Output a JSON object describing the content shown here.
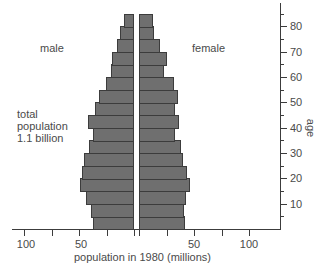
{
  "chart_data": {
    "type": "bar",
    "orientation": "horizontal",
    "subtype": "population-pyramid",
    "title": "",
    "xlabel": "population in 1980 (millions)",
    "ylabel": "age",
    "annotations": {
      "male_label": "male",
      "female_label": "female",
      "total_line1": "total",
      "total_line2": "population",
      "total_line3": "1.1 billion"
    },
    "categories": [
      "0-4",
      "5-9",
      "10-14",
      "15-19",
      "20-24",
      "25-29",
      "30-34",
      "35-39",
      "40-44",
      "45-49",
      "50-54",
      "55-59",
      "60-64",
      "65-69",
      "70-74",
      "75-79",
      "80-84"
    ],
    "series": [
      {
        "name": "male",
        "values": [
          37,
          39,
          44,
          49,
          47,
          45,
          41,
          37,
          42,
          35,
          32,
          25,
          21,
          20,
          15,
          12.5,
          9
        ]
      },
      {
        "name": "female",
        "values": [
          42,
          41,
          42.5,
          46,
          44,
          40,
          38,
          33,
          36,
          32.5,
          35.5,
          32,
          23,
          25,
          19,
          14,
          12.5
        ]
      }
    ],
    "x_ticks_left": [
      100,
      75,
      50,
      25,
      0
    ],
    "x_tick_labels_left": [
      "100",
      "50"
    ],
    "x_ticks_right": [
      0,
      25,
      50,
      75,
      100
    ],
    "x_tick_labels_right": [
      "50",
      "100"
    ],
    "y_ticks": [
      10,
      20,
      30,
      40,
      50,
      60,
      70,
      80
    ],
    "y_tick_labels": [
      "10",
      "20",
      "30",
      "40",
      "50",
      "60",
      "70",
      "80"
    ],
    "xlim": [
      0,
      100
    ],
    "ylim": [
      0,
      90
    ],
    "grid": false,
    "colors": {
      "bar_fill": "#6f6f6f",
      "bar_border": "#3c3c3c",
      "axis": "#3c3c3c",
      "text": "#4a4a4a"
    }
  }
}
